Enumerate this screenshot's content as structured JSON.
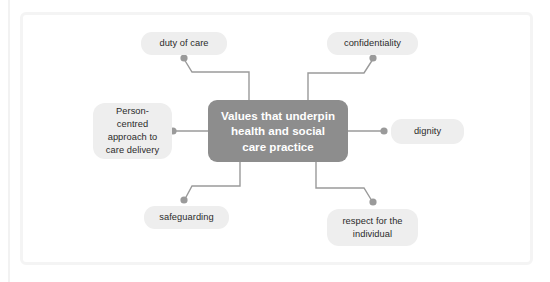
{
  "diagram": {
    "type": "mind-map",
    "central": {
      "label": "Values that underpin health and social care practice",
      "lines": [
        "Values that underpin",
        "health and social",
        "care practice"
      ],
      "fill": "#8d8d8d",
      "text_color": "#ffffff"
    },
    "node_fill": "#eeeeee",
    "node_text_color": "#2b2b2b",
    "connector_color": "#9a9a9a",
    "frame_color": "#f4f4f4",
    "nodes": [
      {
        "id": "duty-of-care",
        "label": "duty of care",
        "lines": [
          "duty of care"
        ],
        "position": "top-left"
      },
      {
        "id": "confidentiality",
        "label": "confidentiality",
        "lines": [
          "confidentiality"
        ],
        "position": "top-right"
      },
      {
        "id": "person-centred",
        "label": "Person-centred approach to care delivery",
        "lines": [
          "Person-centred",
          "approach to",
          "care delivery"
        ],
        "position": "left"
      },
      {
        "id": "dignity",
        "label": "dignity",
        "lines": [
          "dignity"
        ],
        "position": "right"
      },
      {
        "id": "safeguarding",
        "label": "safeguarding",
        "lines": [
          "safeguarding"
        ],
        "position": "bottom-left"
      },
      {
        "id": "respect-for-the-individual",
        "label": "respect for the individual",
        "lines": [
          "respect for the",
          "individual"
        ],
        "position": "bottom-right"
      }
    ]
  }
}
